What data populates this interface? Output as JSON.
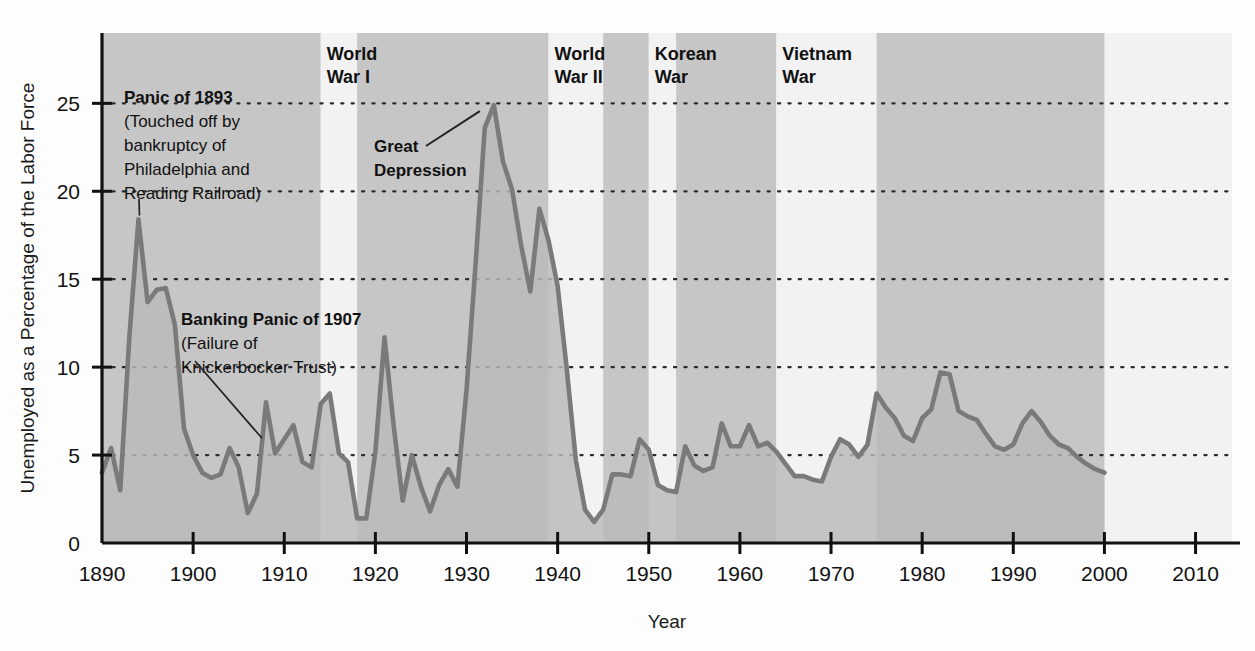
{
  "chart_data": {
    "type": "area",
    "title": "",
    "xlabel": "Year",
    "ylabel": "Unemployed as a Percentage of the Labor Force",
    "xlim": [
      1890,
      2014
    ],
    "ylim": [
      0,
      29
    ],
    "xticks": [
      1890,
      1900,
      1910,
      1920,
      1930,
      1940,
      1950,
      1960,
      1970,
      1980,
      1990,
      2000,
      2010
    ],
    "yticks": [
      0,
      5,
      10,
      15,
      20,
      25
    ],
    "grid": "horizontal-dotted",
    "legend": "none",
    "series_name": "Unemployment rate",
    "line_color": "#7a7a7a",
    "fill_color": "#b9b9b9",
    "band_dark_color": "#c6c6c6",
    "band_light_color": "#f2f2f2",
    "x": [
      1890,
      1891,
      1892,
      1893,
      1894,
      1895,
      1896,
      1897,
      1898,
      1899,
      1900,
      1901,
      1902,
      1903,
      1904,
      1905,
      1906,
      1907,
      1908,
      1909,
      1910,
      1911,
      1912,
      1913,
      1914,
      1915,
      1916,
      1917,
      1918,
      1919,
      1920,
      1921,
      1922,
      1923,
      1924,
      1925,
      1926,
      1927,
      1928,
      1929,
      1930,
      1931,
      1932,
      1933,
      1934,
      1935,
      1936,
      1937,
      1938,
      1939,
      1940,
      1941,
      1942,
      1943,
      1944,
      1945,
      1946,
      1947,
      1948,
      1949,
      1950,
      1951,
      1952,
      1953,
      1954,
      1955,
      1956,
      1957,
      1958,
      1959,
      1960,
      1961,
      1962,
      1963,
      1964,
      1965,
      1966,
      1967,
      1968,
      1969,
      1970,
      1971,
      1972,
      1973,
      1974,
      1975,
      1976,
      1977,
      1978,
      1979,
      1980,
      1981,
      1982,
      1983,
      1984,
      1985,
      1986,
      1987,
      1988,
      1989,
      1990,
      1991,
      1992,
      1993,
      1994,
      1995,
      1996,
      1997,
      1998,
      1999,
      2000
    ],
    "values": [
      4.0,
      5.4,
      3.0,
      11.7,
      18.4,
      13.7,
      14.4,
      14.5,
      12.4,
      6.5,
      5.0,
      4.0,
      3.7,
      3.9,
      5.4,
      4.3,
      1.7,
      2.8,
      8.0,
      5.1,
      5.9,
      6.7,
      4.6,
      4.3,
      7.9,
      8.5,
      5.1,
      4.6,
      1.4,
      1.4,
      5.2,
      11.7,
      6.7,
      2.4,
      5.0,
      3.2,
      1.8,
      3.3,
      4.2,
      3.2,
      8.7,
      15.9,
      23.6,
      24.9,
      21.7,
      20.1,
      16.9,
      14.3,
      19.0,
      17.2,
      14.6,
      9.9,
      4.7,
      1.9,
      1.2,
      1.9,
      3.9,
      3.9,
      3.8,
      5.9,
      5.3,
      3.3,
      3.0,
      2.9,
      5.5,
      4.4,
      4.1,
      4.3,
      6.8,
      5.5,
      5.5,
      6.7,
      5.5,
      5.7,
      5.2,
      4.5,
      3.8,
      3.8,
      3.6,
      3.5,
      4.9,
      5.9,
      5.6,
      4.9,
      5.6,
      8.5,
      7.7,
      7.1,
      6.1,
      5.8,
      7.1,
      7.6,
      9.7,
      9.6,
      7.5,
      7.2,
      7.0,
      6.2,
      5.5,
      5.3,
      5.6,
      6.8,
      7.5,
      6.9,
      6.1,
      5.6,
      5.4,
      4.9,
      4.5,
      4.2,
      4.0
    ],
    "war_bands": [
      {
        "label": "World War I",
        "label_line1": "World",
        "label_line2": "War I",
        "start": 1914,
        "end": 1918
      },
      {
        "label": "World War II",
        "label_line1": "World",
        "label_line2": "War II",
        "start": 1939,
        "end": 1945
      },
      {
        "label": "Korean War",
        "label_line1": "Korean",
        "label_line2": "War",
        "start": 1950,
        "end": 1953
      },
      {
        "label": "Vietnam War",
        "label_line1": "Vietnam",
        "label_line2": "War",
        "start": 1964,
        "end": 1975
      }
    ],
    "annotations": [
      {
        "id": "panic-1893",
        "title": "Panic of 1893",
        "lines": [
          "(Touched off by",
          "bankruptcy of",
          "Philadelphia and",
          "Reading Railroad)"
        ],
        "points_to_year": 1894,
        "points_to_value": 18.4
      },
      {
        "id": "banking-panic-1907",
        "title": "Banking Panic of 1907",
        "lines": [
          "(Failure of",
          "Knickerbocker Trust)"
        ],
        "points_to_year": 1908,
        "points_to_value": 8.0
      },
      {
        "id": "great-depression",
        "title": "Great",
        "lines": [
          "Depression"
        ],
        "points_to_year": 1933,
        "points_to_value": 24.9
      }
    ]
  }
}
